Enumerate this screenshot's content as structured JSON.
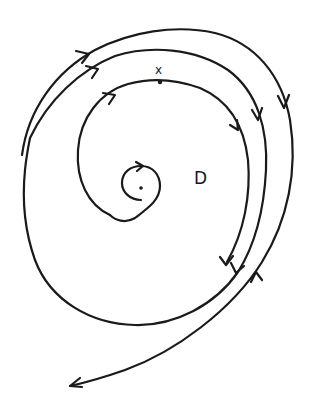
{
  "diagram": {
    "type": "phase-portrait",
    "labels": {
      "point": "x",
      "region": "D"
    },
    "trajectories": [
      {
        "name": "outer-trajectory",
        "direction": "clockwise",
        "arrows": 3
      },
      {
        "name": "middle-trajectory",
        "direction": "clockwise",
        "arrows": 3
      },
      {
        "name": "inner-trajectory",
        "direction": "clockwise",
        "arrows": 2
      },
      {
        "name": "center-spiral",
        "direction": "clockwise",
        "arrows": 1
      }
    ],
    "colors": {
      "ink": "#1a1a1a",
      "background": "#ffffff"
    }
  }
}
